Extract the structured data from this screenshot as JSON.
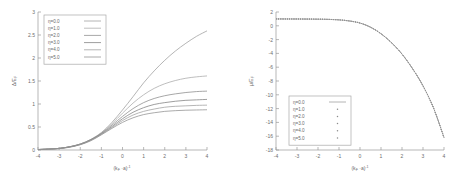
{
  "figure": {
    "background": "#ffffff",
    "axis_color": "#9a9a9a",
    "text_color": "#6d6d6d",
    "panel_count": 2
  },
  "chart_data": [
    {
      "type": "line",
      "panel": "left",
      "title": "",
      "xlabel": "(k_F · a)^-1",
      "xlabel_parts": {
        "prefix": "(k",
        "sub1": "F",
        "mid": " ·a)",
        "sup": "-1"
      },
      "ylabel": "Δ/E_F",
      "ylabel_parts": {
        "main": "Δ/E",
        "sub": "F"
      },
      "xlim": [
        -4,
        4
      ],
      "ylim": [
        0,
        3
      ],
      "xticks": [
        -4,
        -3,
        -2,
        -1,
        0,
        1,
        2,
        3,
        4
      ],
      "xtick_labels": [
        "-4",
        "-3",
        "-2",
        "-1",
        "0",
        "1",
        "2",
        "3",
        "4"
      ],
      "yticks": [
        0,
        0.5,
        1,
        1.5,
        2,
        2.5,
        3
      ],
      "ytick_labels": [
        "0",
        "0.5",
        "1",
        "1.5",
        "2",
        "2.5",
        "3"
      ],
      "grid": false,
      "legend_position": "top-left",
      "x": [
        -4,
        -3.5,
        -3,
        -2.5,
        -2,
        -1.5,
        -1,
        -0.5,
        0,
        0.5,
        1,
        1.5,
        2,
        2.5,
        3,
        3.5,
        4
      ],
      "series": [
        {
          "name": "η=0.0",
          "color": "#9c9c9c",
          "style": "solid",
          "values": [
            0.01,
            0.02,
            0.035,
            0.07,
            0.13,
            0.23,
            0.38,
            0.6,
            0.87,
            1.16,
            1.46,
            1.72,
            1.95,
            2.15,
            2.32,
            2.47,
            2.59
          ]
        },
        {
          "name": "η=1.0",
          "color": "#a8a8a8",
          "style": "solid",
          "values": [
            0.01,
            0.02,
            0.035,
            0.07,
            0.13,
            0.23,
            0.37,
            0.57,
            0.8,
            1.02,
            1.2,
            1.34,
            1.44,
            1.51,
            1.56,
            1.59,
            1.61
          ]
        },
        {
          "name": "η=2.0",
          "color": "#8a8a8a",
          "style": "solid",
          "values": [
            0.01,
            0.02,
            0.035,
            0.07,
            0.13,
            0.22,
            0.36,
            0.54,
            0.73,
            0.9,
            1.03,
            1.12,
            1.18,
            1.22,
            1.25,
            1.27,
            1.28
          ]
        },
        {
          "name": "η=3.0",
          "color": "#7e7e7e",
          "style": "solid",
          "values": [
            0.01,
            0.02,
            0.035,
            0.07,
            0.12,
            0.22,
            0.35,
            0.51,
            0.68,
            0.82,
            0.92,
            0.99,
            1.03,
            1.06,
            1.08,
            1.09,
            1.1
          ]
        },
        {
          "name": "η=4.0",
          "color": "#9e9e9e",
          "style": "solid",
          "values": [
            0.01,
            0.02,
            0.03,
            0.065,
            0.12,
            0.21,
            0.34,
            0.49,
            0.64,
            0.76,
            0.84,
            0.89,
            0.93,
            0.95,
            0.96,
            0.97,
            0.975
          ]
        },
        {
          "name": "η=5.0",
          "color": "#8f8f8f",
          "style": "solid",
          "values": [
            0.01,
            0.02,
            0.03,
            0.06,
            0.115,
            0.2,
            0.33,
            0.47,
            0.6,
            0.7,
            0.77,
            0.81,
            0.84,
            0.855,
            0.865,
            0.87,
            0.875
          ]
        }
      ],
      "legend": [
        {
          "label": "η=0.0",
          "marker": "line"
        },
        {
          "label": "η=1.0",
          "marker": "line"
        },
        {
          "label": "η=2.0",
          "marker": "line"
        },
        {
          "label": "η=3.0",
          "marker": "line"
        },
        {
          "label": "η=4.0",
          "marker": "line"
        },
        {
          "label": "η=5.0",
          "marker": "line"
        }
      ]
    },
    {
      "type": "line",
      "panel": "right",
      "title": "",
      "xlabel": "(k_F · a)^-1",
      "xlabel_parts": {
        "prefix": "(k",
        "sub1": "F",
        "mid": " ·a)",
        "sup": "-1"
      },
      "ylabel": "μ/E_F",
      "ylabel_parts": {
        "main": "μ/E",
        "sub": "F"
      },
      "xlim": [
        -4,
        4
      ],
      "ylim": [
        -18,
        2
      ],
      "xticks": [
        -4,
        -3,
        -2,
        -1,
        0,
        1,
        2,
        3,
        4
      ],
      "xtick_labels": [
        "-4",
        "-3",
        "-2",
        "-1",
        "0",
        "1",
        "2",
        "3",
        "4"
      ],
      "yticks": [
        2,
        0,
        -2,
        -4,
        -6,
        -8,
        -10,
        -12,
        -14,
        -16,
        -18
      ],
      "ytick_labels": [
        "2",
        "0",
        "-2",
        "-4",
        "-6",
        "-8",
        "-10",
        "-12",
        "-14",
        "-16",
        "-18"
      ],
      "grid": false,
      "legend_position": "bottom-left",
      "x": [
        -4,
        -3.5,
        -3,
        -2.5,
        -2,
        -1.5,
        -1,
        -0.5,
        0,
        0.5,
        1,
        1.5,
        2,
        2.5,
        3,
        3.5,
        4
      ],
      "series": [
        {
          "name": "η=0.0",
          "color": "#9c9c9c",
          "style": "solid",
          "values": [
            0.995,
            0.99,
            0.985,
            0.975,
            0.96,
            0.93,
            0.86,
            0.7,
            0.4,
            -0.2,
            -1.15,
            -2.45,
            -4.1,
            -6.2,
            -8.7,
            -11.9,
            -16.2
          ]
        },
        {
          "name": "η=1.0",
          "color": "#a8a8a8",
          "style": "points",
          "values": [
            0.995,
            0.99,
            0.985,
            0.975,
            0.96,
            0.93,
            0.86,
            0.7,
            0.4,
            -0.2,
            -1.15,
            -2.45,
            -4.1,
            -6.2,
            -8.7,
            -11.9,
            -16.2
          ]
        },
        {
          "name": "η=2.0",
          "color": "#8a8a8a",
          "style": "points",
          "values": [
            0.995,
            0.99,
            0.985,
            0.975,
            0.96,
            0.93,
            0.86,
            0.7,
            0.4,
            -0.2,
            -1.15,
            -2.45,
            -4.1,
            -6.2,
            -8.7,
            -11.9,
            -16.2
          ]
        },
        {
          "name": "η=3.0",
          "color": "#7e7e7e",
          "style": "points",
          "values": [
            0.995,
            0.99,
            0.985,
            0.975,
            0.96,
            0.93,
            0.86,
            0.7,
            0.4,
            -0.2,
            -1.15,
            -2.45,
            -4.1,
            -6.2,
            -8.7,
            -11.9,
            -16.2
          ]
        },
        {
          "name": "η=4.0",
          "color": "#9e9e9e",
          "style": "points",
          "values": [
            0.995,
            0.99,
            0.985,
            0.975,
            0.96,
            0.93,
            0.86,
            0.7,
            0.4,
            -0.2,
            -1.15,
            -2.45,
            -4.1,
            -6.2,
            -8.7,
            -11.9,
            -16.2
          ]
        },
        {
          "name": "η=5.0",
          "color": "#8f8f8f",
          "style": "points",
          "values": [
            0.995,
            0.99,
            0.985,
            0.975,
            0.96,
            0.93,
            0.86,
            0.7,
            0.4,
            -0.2,
            -1.15,
            -2.45,
            -4.1,
            -6.2,
            -8.7,
            -11.9,
            -16.2
          ]
        }
      ],
      "legend": [
        {
          "label": "η=0.0",
          "marker": "line"
        },
        {
          "label": "η=1.0",
          "marker": "point"
        },
        {
          "label": "η=2.0",
          "marker": "point"
        },
        {
          "label": "η=3.0",
          "marker": "point"
        },
        {
          "label": "η=4.0",
          "marker": "point"
        },
        {
          "label": "η=5.0",
          "marker": "point"
        }
      ]
    }
  ]
}
